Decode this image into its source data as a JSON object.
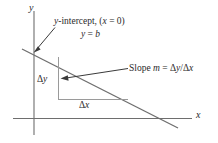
{
  "figure": {
    "background_color": "#ffffff",
    "axis_color": "#6e6e6e",
    "line_color": "#6e6e6e",
    "guide_color": "#9a9a9a",
    "text_color": "#2b2b2b"
  },
  "axes": {
    "y_label": "y",
    "x_label": "x"
  },
  "annotations": {
    "y_intercept": "y-intercept, (x = 0)",
    "y_equals_b": "y = b",
    "slope": "Slope m = Δy/Δx",
    "delta_y": "Δy",
    "delta_x": "Δx"
  },
  "chart_data": {
    "type": "line",
    "title": "",
    "xlabel": "x",
    "ylabel": "y",
    "grid": false,
    "legend": "none",
    "series": [
      {
        "name": "y = mx + b",
        "points": [
          [
            22,
            49
          ],
          [
            178,
            128
          ]
        ],
        "slope_sign": "negative"
      }
    ],
    "annotations": [
      {
        "label": "y-intercept, (x = 0)",
        "target": [
          34,
          52
        ]
      },
      {
        "label": "y = b",
        "target": [
          34,
          52
        ]
      },
      {
        "label": "Slope m = Δy/Δx",
        "target": [
          62,
          78
        ]
      },
      {
        "label": "Δy",
        "target": [
          58,
          78
        ]
      },
      {
        "label": "Δx",
        "target": [
          93,
          99
        ]
      }
    ]
  }
}
